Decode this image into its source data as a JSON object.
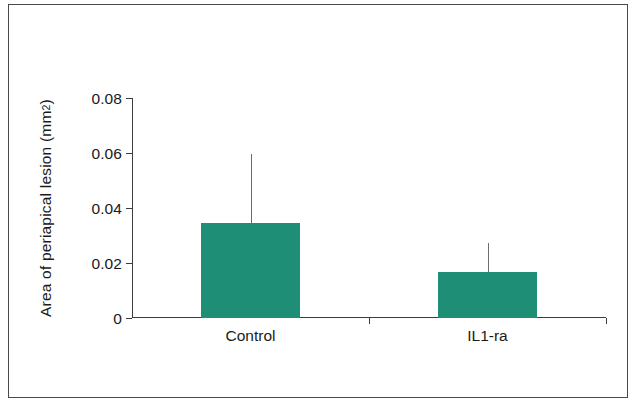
{
  "figure": {
    "background_color": "#ffffff",
    "frame_color": "#4a4a4a",
    "axis_color": "#3c3c3c"
  },
  "axis_title": {
    "prefix": "Area of periapical lesion (mm",
    "superscript": "2",
    "suffix": ")"
  },
  "chart_data": {
    "type": "bar",
    "title": "",
    "subtitle": "",
    "xlabel": "",
    "ylabel": "Area of periapical lesion (mm2)",
    "categories": [
      "Control",
      "IL1-ra"
    ],
    "values": [
      0.0345,
      0.0167
    ],
    "errors_upper": [
      0.0596,
      0.0273
    ],
    "error_style": "upper-whisker-only",
    "ylim": [
      0,
      0.08
    ],
    "yticks": [
      0,
      0.02,
      0.04,
      0.06,
      0.08
    ],
    "ytick_labels": [
      "0",
      "0.02",
      "0.04",
      "0.06",
      "0.08"
    ],
    "grid": false,
    "legend": "none",
    "bar_color": "#1e8e76",
    "error_color": "#6d6d6d",
    "bar_width_fraction": 0.42
  }
}
